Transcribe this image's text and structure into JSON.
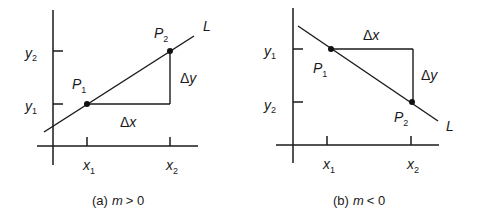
{
  "figure": {
    "colors": {
      "ink": "#1a1a1a",
      "background": "#ffffff"
    },
    "panels": [
      {
        "id": "a",
        "caption_prefix": "(a)",
        "caption_var": "m",
        "caption_rel": "> 0",
        "line_label": "L",
        "points": [
          {
            "name": "P",
            "sub": "1"
          },
          {
            "name": "P",
            "sub": "2"
          }
        ],
        "y_ticks": [
          {
            "name": "y",
            "sub": "2"
          },
          {
            "name": "y",
            "sub": "1"
          }
        ],
        "x_ticks": [
          {
            "name": "x",
            "sub": "1"
          },
          {
            "name": "x",
            "sub": "2"
          }
        ],
        "dx_label": "Δx",
        "dy_label": "Δy",
        "dx_delta": "Δ",
        "dx_var": "x",
        "dy_delta": "Δ",
        "dy_var": "y"
      },
      {
        "id": "b",
        "caption_prefix": "(b)",
        "caption_var": "m",
        "caption_rel": "< 0",
        "line_label": "L",
        "points": [
          {
            "name": "P",
            "sub": "1"
          },
          {
            "name": "P",
            "sub": "2"
          }
        ],
        "y_ticks": [
          {
            "name": "y",
            "sub": "1"
          },
          {
            "name": "y",
            "sub": "2"
          }
        ],
        "x_ticks": [
          {
            "name": "x",
            "sub": "1"
          },
          {
            "name": "x",
            "sub": "2"
          }
        ],
        "dx_label": "Δx",
        "dy_label": "Δy",
        "dx_delta": "Δ",
        "dx_var": "x",
        "dy_delta": "Δ",
        "dy_var": "y"
      }
    ]
  }
}
